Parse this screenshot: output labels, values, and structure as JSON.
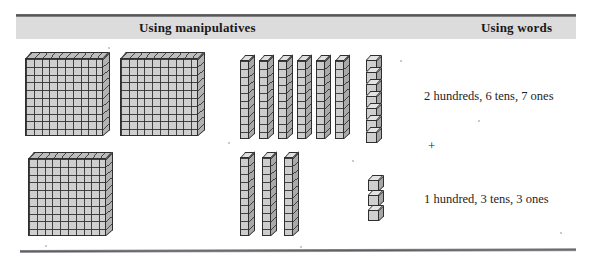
{
  "figure": {
    "name": "base-ten-blocks-addition-figure",
    "headers": {
      "manipulatives": "Using manipulatives",
      "words": "Using words"
    },
    "words_column": {
      "addend_1": "2 hundreds, 6 tens, 7 ones",
      "operator": "+",
      "addend_2": "1 hundred, 3 tens, 3 ones"
    },
    "manipulatives_column": {
      "rows": [
        {
          "label": "first-addend-blocks",
          "hundreds_flats": 2,
          "tens_rods": 6,
          "ones_cubes": 7
        },
        {
          "label": "second-addend-blocks",
          "hundreds_flats": 1,
          "tens_rods": 3,
          "ones_cubes": 3
        }
      ]
    },
    "colors": {
      "header_band": "#dcdcdc",
      "rule": "#54545a",
      "block_face": "#cfcfcf",
      "block_outline": "#2f2f2f",
      "text": "#1b1b1b"
    },
    "geometry": {
      "flats_row1": [
        [
          25,
          52
        ],
        [
          120,
          52
        ]
      ],
      "flats_row2": [
        [
          28,
          152
        ]
      ],
      "rods_row1": [
        [
          240,
          55
        ],
        [
          259,
          55
        ],
        [
          278,
          55
        ],
        [
          297,
          55
        ],
        [
          316,
          55
        ],
        [
          335,
          55
        ]
      ],
      "rods_row2": [
        [
          240,
          152
        ],
        [
          262,
          152
        ],
        [
          284,
          152
        ]
      ],
      "cubes_row1": [
        [
          366,
          55
        ],
        [
          366,
          67
        ],
        [
          366,
          79
        ],
        [
          366,
          91
        ],
        [
          366,
          103
        ],
        [
          366,
          115
        ],
        [
          366,
          127
        ]
      ],
      "cubes_row2": [
        [
          368,
          175
        ],
        [
          368,
          190
        ],
        [
          368,
          205
        ]
      ]
    }
  }
}
